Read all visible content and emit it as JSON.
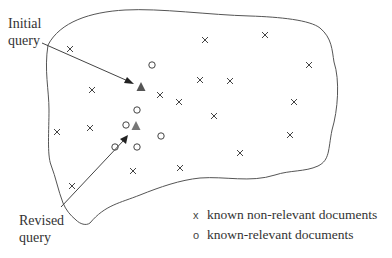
{
  "labels": {
    "initial_query": [
      "Initial",
      "query"
    ],
    "revised_query": [
      "Revised",
      "query"
    ]
  },
  "legend": [
    {
      "symbol": "x",
      "text": "known non-relevant documents"
    },
    {
      "symbol": "o",
      "text": "known-relevant documents"
    }
  ],
  "colors": {
    "stroke": "#555555",
    "triangle": "#555555",
    "text": "#333333"
  },
  "non_relevant_docs": [
    [
      70,
      49
    ],
    [
      205,
      40
    ],
    [
      265,
      35
    ],
    [
      309,
      65
    ],
    [
      92,
      90
    ],
    [
      160,
      95
    ],
    [
      179,
      102
    ],
    [
      200,
      80
    ],
    [
      230,
      81
    ],
    [
      294,
      102
    ],
    [
      57,
      132
    ],
    [
      90,
      128
    ],
    [
      214,
      116
    ],
    [
      290,
      135
    ],
    [
      240,
      153
    ],
    [
      133,
      171
    ],
    [
      180,
      168
    ],
    [
      72,
      186
    ]
  ],
  "relevant_docs": [
    [
      152,
      65
    ],
    [
      137,
      110
    ],
    [
      126,
      125
    ],
    [
      161,
      136
    ],
    [
      115,
      147
    ],
    [
      137,
      147
    ]
  ],
  "initial_query_point": [
    141,
    87
  ],
  "revised_query_point": [
    136,
    126
  ]
}
